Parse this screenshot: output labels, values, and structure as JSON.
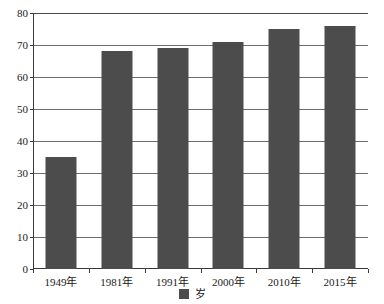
{
  "chart_data": {
    "type": "bar",
    "title": "",
    "subtitle": "",
    "xlabel": "",
    "ylabel": "",
    "categories": [
      "1949年",
      "1981年",
      "1991年",
      "2000年",
      "2010年",
      "2015年"
    ],
    "series": [
      {
        "name": "岁",
        "values": [
          35,
          68,
          69,
          71,
          75,
          76
        ]
      }
    ],
    "values": [
      35,
      68,
      69,
      71,
      75,
      76
    ],
    "ylim": [
      0,
      80
    ],
    "yticks": [
      0,
      10,
      20,
      30,
      40,
      50,
      60,
      70,
      80
    ],
    "ytick_labels": [
      "0",
      "10",
      "20",
      "30",
      "40",
      "50",
      "60",
      "70",
      "80"
    ],
    "grid": true,
    "grid_axis": "y",
    "legend": {
      "position": "bottom",
      "entries": [
        {
          "label": "岁",
          "color": "#4c4c4c",
          "marker": "square"
        }
      ]
    },
    "bar_color": "#4c4c4c",
    "axis_color": "#3a3a3a",
    "grid_color": "#6e6e6e",
    "background": "#ffffff"
  }
}
